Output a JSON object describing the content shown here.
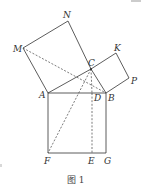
{
  "figure": {
    "caption": "图 1",
    "colors": {
      "line": "#333333",
      "background": "#ffffff"
    },
    "points": {
      "A": {
        "label": "A",
        "x": 48,
        "y": 93
      },
      "B": {
        "label": "B",
        "x": 106,
        "y": 93
      },
      "C": {
        "label": "C",
        "x": 91,
        "y": 69
      },
      "D": {
        "label": "D",
        "x": 92,
        "y": 93
      },
      "E": {
        "label": "E",
        "x": 92,
        "y": 153
      },
      "F": {
        "label": "F",
        "x": 48,
        "y": 153
      },
      "G": {
        "label": "G",
        "x": 106,
        "y": 153
      },
      "M": {
        "label": "M",
        "x": 23,
        "y": 48
      },
      "N": {
        "label": "N",
        "x": 68,
        "y": 21
      },
      "K": {
        "label": "K",
        "x": 116,
        "y": 53
      },
      "P": {
        "label": "P",
        "x": 129,
        "y": 78
      }
    },
    "solid_segments": [
      "AB",
      "BC",
      "CA",
      "AM",
      "MN",
      "NC",
      "CK",
      "KP",
      "PB",
      "AF",
      "FG",
      "GB"
    ],
    "dashed_segments": [
      "MB",
      "CF",
      "CD",
      "DE"
    ]
  }
}
